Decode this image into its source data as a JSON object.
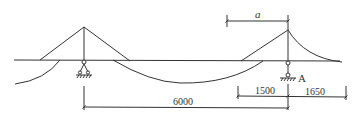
{
  "diagram": {
    "type": "structural-beam-with-cable-towers",
    "colors": {
      "line": "#333333",
      "background": "#ffffff"
    },
    "labels": {
      "support_a": "A",
      "dim_a": "a"
    },
    "dimensions": {
      "span_6000": "6000",
      "span_1500": "1500",
      "span_1650": "1650"
    },
    "components": [
      {
        "id": "beam",
        "desc": "horizontal beam"
      },
      {
        "id": "left-tower",
        "desc": "left triangular tower with cables"
      },
      {
        "id": "right-tower",
        "desc": "right tower with straight and curved cables"
      },
      {
        "id": "left-support",
        "desc": "pin support"
      },
      {
        "id": "right-support",
        "desc": "pin support A"
      },
      {
        "id": "middle-cable",
        "desc": "sagging cable between towers"
      },
      {
        "id": "left-curve",
        "desc": "curved cable at left end"
      }
    ]
  }
}
